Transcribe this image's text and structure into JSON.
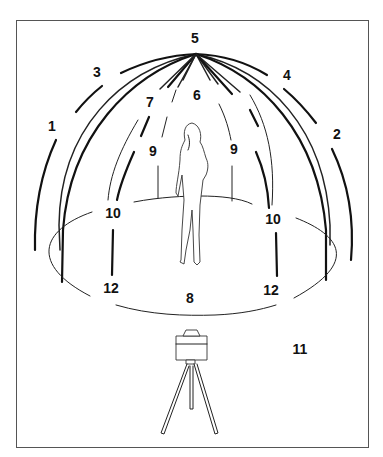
{
  "diagram": {
    "labels": [
      {
        "id": "label-1",
        "text": "1",
        "x": 52,
        "y": 131
      },
      {
        "id": "label-2",
        "text": "2",
        "x": 337,
        "y": 139
      },
      {
        "id": "label-3",
        "text": "3",
        "x": 97,
        "y": 77
      },
      {
        "id": "label-4",
        "text": "4",
        "x": 287,
        "y": 80
      },
      {
        "id": "label-5",
        "text": "5",
        "x": 195,
        "y": 43
      },
      {
        "id": "label-6",
        "text": "6",
        "x": 197,
        "y": 100
      },
      {
        "id": "label-7",
        "text": "7",
        "x": 150,
        "y": 107
      },
      {
        "id": "label-9-left",
        "text": "9",
        "x": 153,
        "y": 156
      },
      {
        "id": "label-9-right",
        "text": "9",
        "x": 234,
        "y": 154
      },
      {
        "id": "label-10-left",
        "text": "10",
        "x": 113,
        "y": 218
      },
      {
        "id": "label-10-right",
        "text": "10",
        "x": 273,
        "y": 224
      },
      {
        "id": "label-12-left",
        "text": "12",
        "x": 111,
        "y": 293
      },
      {
        "id": "label-12-right",
        "text": "12",
        "x": 271,
        "y": 295
      },
      {
        "id": "label-8",
        "text": "8",
        "x": 190,
        "y": 303
      },
      {
        "id": "label-11",
        "text": "11",
        "x": 300,
        "y": 354
      }
    ],
    "colors": {
      "line": "#111111",
      "frame": "#555555",
      "background": "#ffffff"
    }
  }
}
